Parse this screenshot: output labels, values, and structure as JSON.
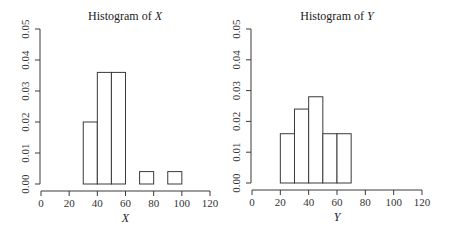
{
  "chart_data": [
    {
      "type": "bar",
      "subtype": "histogram",
      "title": "Histogram of X",
      "title_prefix": "Histogram of ",
      "title_var": "X",
      "xlabel": "X",
      "ylabel": "",
      "xlim": [
        0,
        120
      ],
      "ylim": [
        0,
        0.05
      ],
      "xticks": [
        0,
        20,
        40,
        60,
        80,
        100,
        120
      ],
      "yticks": [
        "0.00",
        "0.01",
        "0.02",
        "0.03",
        "0.04",
        "0.05"
      ],
      "grid": false,
      "bins": [
        {
          "start": 30,
          "end": 40,
          "density": 0.02
        },
        {
          "start": 40,
          "end": 50,
          "density": 0.036
        },
        {
          "start": 50,
          "end": 60,
          "density": 0.036
        },
        {
          "start": 70,
          "end": 80,
          "density": 0.004
        },
        {
          "start": 90,
          "end": 100,
          "density": 0.004
        }
      ]
    },
    {
      "type": "bar",
      "subtype": "histogram",
      "title": "Histogram of Y",
      "title_prefix": "Histogram of ",
      "title_var": "Y",
      "xlabel": "Y",
      "ylabel": "",
      "xlim": [
        0,
        120
      ],
      "ylim": [
        0,
        0.05
      ],
      "xticks": [
        0,
        20,
        40,
        60,
        80,
        100,
        120
      ],
      "yticks": [
        "0.00",
        "0.01",
        "0.02",
        "0.03",
        "0.04",
        "0.05"
      ],
      "grid": false,
      "bins": [
        {
          "start": 20,
          "end": 30,
          "density": 0.016
        },
        {
          "start": 30,
          "end": 40,
          "density": 0.024
        },
        {
          "start": 40,
          "end": 50,
          "density": 0.028
        },
        {
          "start": 50,
          "end": 60,
          "density": 0.016
        },
        {
          "start": 60,
          "end": 70,
          "density": 0.016
        }
      ]
    }
  ]
}
